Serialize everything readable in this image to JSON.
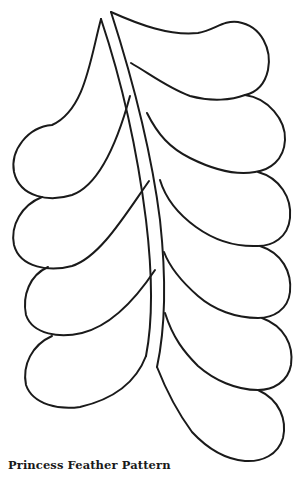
{
  "caption": "Princess Feather Pattern",
  "colors": {
    "line": "#1a1a1a",
    "background": "#ffffff"
  },
  "figure": {
    "left_plumes": 4,
    "right_plumes": 7
  }
}
